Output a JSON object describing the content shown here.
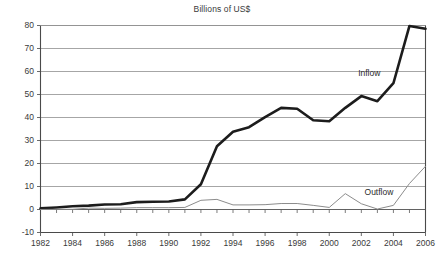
{
  "chart_data": {
    "type": "line",
    "title": "Billions of US$",
    "xlabel": "",
    "ylabel": "",
    "xlim": [
      1982,
      2006
    ],
    "ylim": [
      -10,
      80
    ],
    "grid": true,
    "legend_position": "inline-annotation",
    "y_ticks": [
      80,
      70,
      60,
      50,
      40,
      30,
      20,
      10,
      0,
      -10
    ],
    "y_tick_labels": [
      "80",
      "70",
      "60",
      "50",
      "40",
      "30",
      "20",
      "10",
      "0",
      "-10"
    ],
    "x_ticks": [
      1982,
      1984,
      1986,
      1988,
      1990,
      1992,
      1994,
      1996,
      1998,
      2000,
      2002,
      2004,
      2006
    ],
    "x_tick_labels": [
      "1982",
      "1984",
      "1986",
      "1988",
      "1990",
      "1992",
      "1994",
      "1996",
      "1998",
      "2000",
      "2002",
      "2004",
      "2006"
    ],
    "x_minor_tick_interval": 1,
    "x": [
      1982,
      1983,
      1984,
      1985,
      1986,
      1987,
      1988,
      1989,
      1990,
      1991,
      1992,
      1993,
      1994,
      1995,
      1996,
      1997,
      1998,
      1999,
      2000,
      2001,
      2002,
      2003,
      2004,
      2005,
      2006
    ],
    "series": [
      {
        "name": "Inflow",
        "color": "#1c1c1c",
        "width": 2.6,
        "label_text": "Inflow",
        "values": [
          0.5,
          0.9,
          1.4,
          1.7,
          2.2,
          2.3,
          3.2,
          3.4,
          3.5,
          4.4,
          11.0,
          27.5,
          33.8,
          35.8,
          40.2,
          44.2,
          43.8,
          38.8,
          38.4,
          44.2,
          49.3,
          47.1,
          54.9,
          79.8,
          78.6
        ]
      },
      {
        "name": "Outflow",
        "color": "#8c8c8c",
        "width": 1.0,
        "label_text": "Outflow",
        "values": [
          0.0,
          0.1,
          0.1,
          0.6,
          0.5,
          0.6,
          0.8,
          0.8,
          0.8,
          0.9,
          4.0,
          4.4,
          2.0,
          2.0,
          2.1,
          2.6,
          2.6,
          1.8,
          0.9,
          6.9,
          2.5,
          0.2,
          1.8,
          11.3,
          18.8
        ]
      }
    ],
    "annotations": [
      {
        "text": "Inflow",
        "x": 2001.8,
        "y": 59.0
      },
      {
        "text": "Outflow",
        "x": 2002.2,
        "y": 7.5
      }
    ]
  }
}
